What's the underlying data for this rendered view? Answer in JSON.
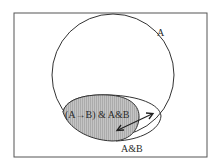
{
  "diagram": {
    "set_a_label": "A",
    "set_ab_label": "A&B",
    "shaded_region_label": "(A→B) & A&B",
    "colors": {
      "stroke": "#333333",
      "shaded_fill": "#b8b8b8",
      "background": "#ffffff"
    }
  }
}
